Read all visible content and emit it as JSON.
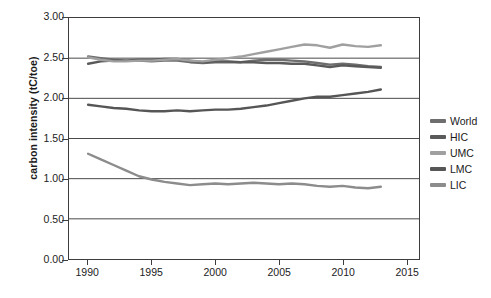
{
  "chart_data": {
    "type": "line",
    "title": "",
    "xlabel": "",
    "ylabel": "carbon intensity (tC/toe)",
    "xlim": [
      1988.5,
      2016
    ],
    "ylim": [
      0.0,
      3.0
    ],
    "grid": true,
    "legend_position": "right",
    "ytick_labels": [
      "3.00",
      "2.50",
      "2.00",
      "1.50",
      "1.00",
      "0.50",
      "0.00"
    ],
    "ytick_values": [
      3.0,
      2.5,
      2.0,
      1.5,
      1.0,
      0.5,
      0.0
    ],
    "xtick_labels": [
      "1990",
      "1995",
      "2000",
      "2005",
      "2010",
      "2015"
    ],
    "xtick_values": [
      1990,
      1995,
      2000,
      2005,
      2010,
      2015
    ],
    "x": [
      1990,
      1991,
      1992,
      1993,
      1994,
      1995,
      1996,
      1997,
      1998,
      1999,
      2000,
      2001,
      2002,
      2003,
      2004,
      2005,
      2006,
      2007,
      2008,
      2009,
      2010,
      2011,
      2012,
      2013
    ],
    "series": [
      {
        "name": "World",
        "color": "#6e6e6e",
        "values": [
          2.52,
          2.5,
          2.48,
          2.47,
          2.47,
          2.46,
          2.47,
          2.47,
          2.45,
          2.44,
          2.45,
          2.45,
          2.45,
          2.47,
          2.48,
          2.48,
          2.47,
          2.46,
          2.44,
          2.42,
          2.43,
          2.42,
          2.4,
          2.39
        ]
      },
      {
        "name": "HIC",
        "color": "#5a5a5a",
        "values": [
          2.43,
          2.46,
          2.47,
          2.47,
          2.48,
          2.48,
          2.49,
          2.49,
          2.47,
          2.45,
          2.46,
          2.46,
          2.45,
          2.45,
          2.44,
          2.44,
          2.43,
          2.43,
          2.41,
          2.39,
          2.41,
          2.4,
          2.39,
          2.38
        ]
      },
      {
        "name": "UMC",
        "color": "#a0a0a0",
        "values": [
          2.51,
          2.48,
          2.46,
          2.46,
          2.47,
          2.47,
          2.48,
          2.49,
          2.47,
          2.46,
          2.48,
          2.5,
          2.52,
          2.55,
          2.58,
          2.61,
          2.64,
          2.67,
          2.66,
          2.63,
          2.67,
          2.65,
          2.64,
          2.66
        ]
      },
      {
        "name": "LMC",
        "color": "#565656",
        "values": [
          1.92,
          1.9,
          1.88,
          1.87,
          1.85,
          1.84,
          1.84,
          1.85,
          1.84,
          1.85,
          1.86,
          1.86,
          1.87,
          1.89,
          1.91,
          1.94,
          1.97,
          2.0,
          2.02,
          2.02,
          2.04,
          2.06,
          2.08,
          2.11
        ]
      },
      {
        "name": "LIC",
        "color": "#8c8c8c",
        "values": [
          1.31,
          1.24,
          1.17,
          1.1,
          1.03,
          0.99,
          0.96,
          0.94,
          0.92,
          0.93,
          0.94,
          0.93,
          0.94,
          0.95,
          0.94,
          0.93,
          0.94,
          0.93,
          0.91,
          0.9,
          0.91,
          0.89,
          0.88,
          0.9
        ]
      }
    ]
  },
  "legend": {
    "items": [
      {
        "label": "World"
      },
      {
        "label": "HIC"
      },
      {
        "label": "UMC"
      },
      {
        "label": "LMC"
      },
      {
        "label": "LIC"
      }
    ]
  }
}
